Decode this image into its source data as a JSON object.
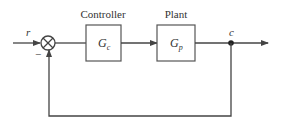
{
  "diagram": {
    "type": "feedback-control-block-diagram",
    "signals": {
      "input": "r",
      "output": "c",
      "feedback_sign": "−"
    },
    "blocks": [
      {
        "id": "controller",
        "title": "Controller",
        "symbol": "G",
        "subscript": "c"
      },
      {
        "id": "plant",
        "title": "Plant",
        "symbol": "G",
        "subscript": "p"
      }
    ],
    "summing_junction": {
      "symbol": "⊗"
    },
    "colors": {
      "stroke": "#444444",
      "background": "#ffffff"
    }
  }
}
